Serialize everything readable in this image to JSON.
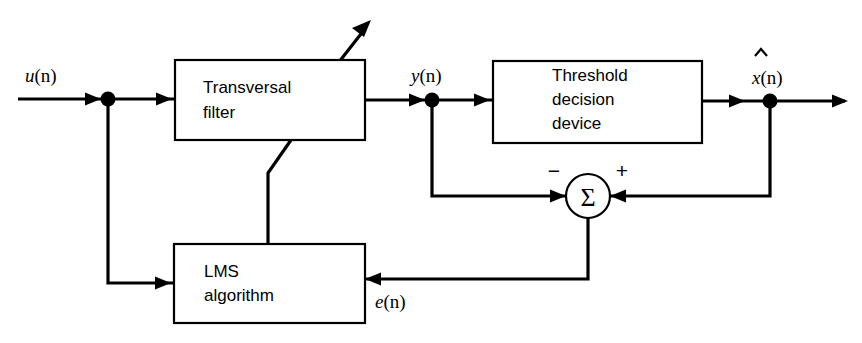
{
  "diagram": {
    "blocks": [
      {
        "id": "transversal-filter",
        "lines": [
          "Transversal",
          "filter"
        ],
        "x": 175,
        "y": 60,
        "w": 190,
        "h": 80
      },
      {
        "id": "threshold-decision-device",
        "lines": [
          "Threshold",
          "decision",
          "device"
        ],
        "x": 493,
        "y": 61,
        "w": 209,
        "h": 82
      },
      {
        "id": "lms-algorithm",
        "lines": [
          "LMS",
          "algorithm"
        ],
        "x": 174,
        "y": 244,
        "w": 191,
        "h": 79
      }
    ],
    "summing_junction": {
      "id": "summing-junction",
      "glyph": "Σ",
      "cx": 588,
      "cy": 196,
      "r": 22,
      "minus_sign": "−",
      "plus_sign": "+"
    },
    "signals": [
      {
        "id": "input-signal",
        "label": "u(n)",
        "base": "u",
        "arg": "(n)",
        "hat": false,
        "x": 25,
        "y": 82
      },
      {
        "id": "filter-output",
        "label": "y(n)",
        "base": "y",
        "arg": "(n)",
        "hat": false,
        "x": 411,
        "y": 82
      },
      {
        "id": "decision-output",
        "label": "x̂(n)",
        "base": "x",
        "arg": "(n)",
        "hat": true,
        "x": 752,
        "y": 84
      },
      {
        "id": "error-signal",
        "label": "e(n)",
        "base": "e",
        "arg": "(n)",
        "hat": false,
        "x": 375,
        "y": 308
      }
    ],
    "colors": {
      "line": "#000000",
      "background": "#ffffff",
      "box_fill": "#ffffff"
    }
  }
}
